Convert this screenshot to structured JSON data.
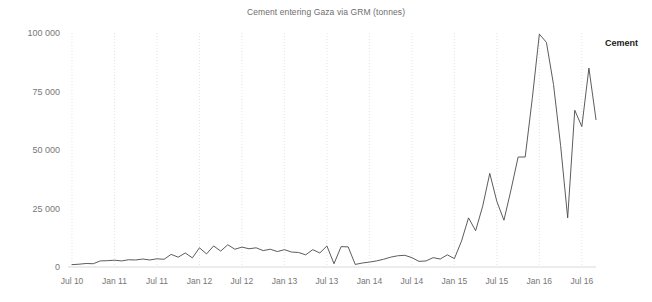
{
  "chart_data": {
    "type": "line",
    "title": "Cement entering Gaza via GRM (tonnes)",
    "xlabel": "",
    "ylabel": "",
    "ylim": [
      0,
      100000
    ],
    "yticks": [
      0,
      25000,
      50000,
      75000,
      100000
    ],
    "ytick_labels": [
      "0",
      "25 000",
      "50 000",
      "75 000",
      "100 000"
    ],
    "xtick_labels": [
      "Jul 10",
      "Jan 11",
      "Jul 11",
      "Jan 12",
      "Jul 12",
      "Jan 13",
      "Jul 13",
      "Jan 14",
      "Jul 14",
      "Jan 15",
      "Jul 15",
      "Jan 16",
      "Jul 16"
    ],
    "grid": "vertical-dotted",
    "legend_position": "right",
    "line_color": "#4a4a4a",
    "series": [
      {
        "name": "Cement",
        "x": [
          "Jul 10",
          "Aug 10",
          "Sep 10",
          "Oct 10",
          "Nov 10",
          "Dec 10",
          "Jan 11",
          "Feb 11",
          "Mar 11",
          "Apr 11",
          "May 11",
          "Jun 11",
          "Jul 11",
          "Aug 11",
          "Sep 11",
          "Oct 11",
          "Nov 11",
          "Dec 11",
          "Jan 12",
          "Feb 12",
          "Mar 12",
          "Apr 12",
          "May 12",
          "Jun 12",
          "Jul 12",
          "Aug 12",
          "Sep 12",
          "Oct 12",
          "Nov 12",
          "Dec 12",
          "Jan 13",
          "Feb 13",
          "Mar 13",
          "Apr 13",
          "May 13",
          "Jun 13",
          "Jul 13",
          "Aug 13",
          "Sep 13",
          "Oct 13",
          "Nov 13",
          "Dec 13",
          "Jan 14",
          "Feb 14",
          "Mar 14",
          "Apr 14",
          "May 14",
          "Jun 14",
          "Jul 14",
          "Aug 14",
          "Sep 14",
          "Oct 14",
          "Nov 14",
          "Dec 14",
          "Jan 15",
          "Feb 15",
          "Mar 15",
          "Apr 15",
          "May 15",
          "Jun 15",
          "Jul 15",
          "Aug 15",
          "Sep 15",
          "Oct 15",
          "Nov 15",
          "Dec 15",
          "Jan 16",
          "Feb 16",
          "Mar 16",
          "Apr 16",
          "May 16",
          "Jun 16",
          "Jul 16",
          "Aug 16",
          "Sep 16"
        ],
        "values": [
          1000,
          1200,
          1500,
          1400,
          2600,
          2700,
          2900,
          2600,
          3100,
          3000,
          3400,
          3000,
          3500,
          3300,
          5400,
          4200,
          6000,
          3900,
          8200,
          5600,
          9000,
          6800,
          9500,
          7600,
          8500,
          7800,
          8200,
          7000,
          7600,
          6600,
          7400,
          6400,
          6200,
          5200,
          7400,
          6000,
          9000,
          1400,
          8700,
          8600,
          1100,
          1700,
          2100,
          2600,
          3300,
          4200,
          4800,
          5000,
          4000,
          2400,
          2600,
          4000,
          3400,
          5200,
          3600,
          11000,
          21000,
          15500,
          26000,
          40000,
          28000,
          20000,
          33000,
          47000,
          47000,
          72000,
          99500,
          96000,
          78000,
          52000,
          21000,
          67000,
          60000,
          85000,
          63000
        ]
      }
    ]
  },
  "legend": {
    "series_label": "Cement"
  }
}
